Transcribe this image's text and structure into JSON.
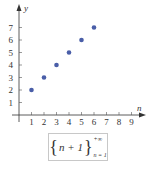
{
  "chart_data": {
    "type": "scatter",
    "title": "",
    "xlabel": "n",
    "ylabel": "y",
    "x": [
      1,
      2,
      3,
      4,
      5,
      6
    ],
    "series": [
      {
        "name": "{n+1}",
        "values": [
          2,
          3,
          4,
          5,
          6,
          7
        ],
        "color": "#4a5ea8"
      }
    ],
    "x_ticks": [
      "1",
      "2",
      "3",
      "4",
      "5",
      "6",
      "7",
      "8",
      "9"
    ],
    "y_ticks": [
      "1",
      "2",
      "3",
      "4",
      "5",
      "6",
      "7"
    ],
    "xlim": [
      0,
      9.8
    ],
    "ylim": [
      0,
      7.8
    ],
    "grid": false,
    "legend": "none"
  },
  "formula": {
    "open_brace": "{",
    "expression": "n + 1",
    "close_brace": "}",
    "upper_limit": "+∞",
    "lower_limit": "n = 1"
  }
}
